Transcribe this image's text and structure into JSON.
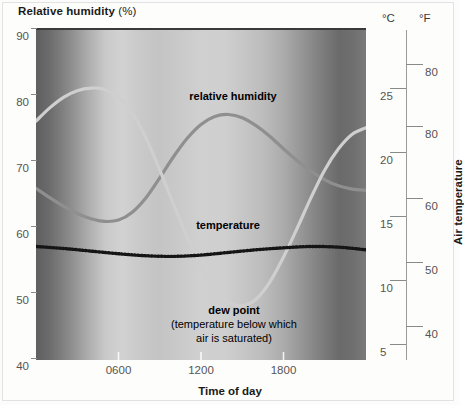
{
  "figure": {
    "y_axis_title_main": "Relative humidity",
    "y_axis_title_unit": "(%)",
    "x_axis_title": "Time of day",
    "right_axis_title": "Air temperature",
    "celsius_unit": "°C",
    "fahrenheit_unit": "°F"
  },
  "annotations": {
    "humidity_label": "relative humidity",
    "temperature_label": "temperature",
    "dewpoint_label": "dew point",
    "dewpoint_sub1": "(temperature below which",
    "dewpoint_sub2": "air is saturated)"
  },
  "colors": {
    "humidity_curve": "#8f8f8f",
    "temperature_curve": "#cfcfcf",
    "dewpoint_curve": "#151515",
    "axis": "#8a8a88",
    "tick_label": "#555553",
    "title": "#1a1a1a",
    "night_edge": "#6d6d6d",
    "day_center": "#d6d6d6"
  },
  "chart_data": {
    "type": "line",
    "title": "Relative humidity (%)",
    "subtitle": "",
    "xlabel": "Time of day",
    "ylabel": "Relative humidity (%)",
    "ylabel_right": "Air temperature",
    "grid": false,
    "legend_position": "inline-annotations",
    "xlim": [
      0,
      24
    ],
    "ylim": [
      40,
      90
    ],
    "x_tick_values": [
      6,
      12,
      18
    ],
    "x_tick_labels": [
      "0600",
      "1200",
      "1800"
    ],
    "y_tick_values": [
      90,
      80,
      70,
      60,
      50,
      40
    ],
    "y_tick_labels": [
      "90",
      "80",
      "70",
      "60",
      "50",
      "40"
    ],
    "right_axis_celsius": {
      "unit": "°C",
      "tick_values": [
        25,
        20,
        15,
        10,
        5
      ],
      "tick_labels": [
        "25",
        "20",
        "15",
        "10",
        "5"
      ]
    },
    "right_axis_fahrenheit": {
      "unit": "°F",
      "tick_values": [
        80,
        80,
        60,
        50,
        40
      ],
      "tick_labels": [
        "80",
        "80",
        "60",
        "50",
        "40"
      ]
    },
    "background": "day-night gradient: dark at left and right edges (night), light through the middle (day)",
    "series": [
      {
        "name": "relative humidity",
        "style": "solid",
        "color": "#8f8f8f",
        "axis": "left",
        "x": [
          0,
          1,
          2,
          3,
          4,
          5,
          6,
          7,
          8,
          9,
          10,
          11,
          12,
          13,
          14,
          15,
          16,
          17,
          18,
          19,
          20,
          21,
          22,
          23,
          24
        ],
        "y": [
          66.0,
          64.6,
          63.3,
          62.2,
          61.4,
          61.0,
          61.2,
          62.4,
          64.6,
          67.6,
          70.8,
          73.6,
          75.7,
          76.9,
          77.2,
          76.7,
          75.5,
          73.9,
          72.0,
          70.2,
          68.6,
          67.3,
          66.4,
          65.9,
          65.7
        ]
      },
      {
        "name": "temperature",
        "style": "solid",
        "color": "#cfcfcf",
        "axis": "right",
        "x": [
          0,
          1,
          2,
          3,
          4,
          5,
          6,
          7,
          8,
          9,
          10,
          11,
          12,
          13,
          14,
          15,
          16,
          17,
          18,
          19,
          20,
          21,
          22,
          23,
          24
        ],
        "y": [
          76.2,
          78.2,
          79.8,
          80.8,
          81.2,
          81.0,
          79.8,
          77.4,
          73.6,
          68.8,
          63.6,
          58.6,
          54.2,
          50.8,
          48.8,
          48.2,
          49.2,
          51.8,
          55.6,
          60.0,
          64.6,
          68.8,
          72.0,
          74.2,
          75.2
        ]
      },
      {
        "name": "dew point",
        "style": "dotted",
        "color": "#151515",
        "axis": "left",
        "x": [
          0,
          2,
          4,
          6,
          8,
          10,
          12,
          14,
          16,
          18,
          20,
          22,
          24
        ],
        "y": [
          57.2,
          56.9,
          56.5,
          56.1,
          55.8,
          55.7,
          55.9,
          56.3,
          56.7,
          57.0,
          57.2,
          57.1,
          56.7
        ]
      }
    ]
  }
}
